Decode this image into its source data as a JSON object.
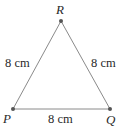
{
  "diagram": {
    "type": "equilateral-triangle",
    "vertices": {
      "R": {
        "label": "R",
        "x": 61,
        "y": 21
      },
      "P": {
        "label": "P",
        "x": 13,
        "y": 109
      },
      "Q": {
        "label": "Q",
        "x": 110,
        "y": 109
      }
    },
    "sides": {
      "PR": {
        "label": "8 cm"
      },
      "RQ": {
        "label": "8 cm"
      },
      "PQ": {
        "label": "8 cm"
      }
    },
    "colors": {
      "line": "#8a8a8a",
      "point": "#555555",
      "text": "#2a2a2a"
    }
  }
}
